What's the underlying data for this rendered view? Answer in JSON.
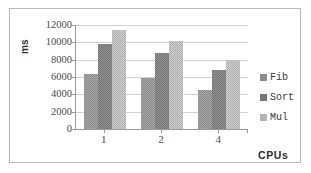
{
  "chart_data": {
    "type": "bar",
    "title": "",
    "subtitle": "",
    "xlabel": "CPUs",
    "ylabel": "ms",
    "categories": [
      "1",
      "2",
      "4"
    ],
    "series": [
      {
        "name": "Fib",
        "values": [
          6300,
          5900,
          4500
        ],
        "color": "#8c8c8c"
      },
      {
        "name": "Sort",
        "values": [
          9800,
          8800,
          6800
        ],
        "color": "#757575"
      },
      {
        "name": "Mul",
        "values": [
          11400,
          10200,
          8000
        ],
        "color": "#b4b4b4"
      }
    ],
    "ylim": [
      0,
      12000
    ],
    "yticks": [
      0,
      2000,
      4000,
      6000,
      8000,
      10000,
      12000
    ],
    "ytick_labels": [
      "0",
      "2000",
      "4000",
      "6000",
      "8000",
      "10000",
      "12000"
    ],
    "grid": true,
    "legend_position": "right",
    "bar_texture": "dithered"
  },
  "frame": {
    "border_color": "#b9b9b9",
    "background": "#ffffff"
  }
}
